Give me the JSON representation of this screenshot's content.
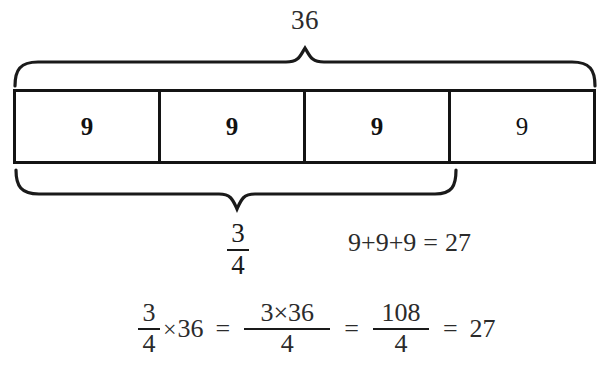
{
  "diagram": {
    "title_label": "36",
    "bar": {
      "cells": [
        {
          "value": "9",
          "emphasis": "bold"
        },
        {
          "value": "9",
          "emphasis": "bold"
        },
        {
          "value": "9",
          "emphasis": "bold"
        },
        {
          "value": "9",
          "emphasis": "regular"
        }
      ]
    },
    "top_brace": {
      "label": "36",
      "spans_cells": 4
    },
    "bottom_brace": {
      "label_numerator": "3",
      "label_denominator": "4",
      "spans_cells": 3
    },
    "sum_line": {
      "terms": "9+9+9",
      "equals": "=",
      "result": "27"
    },
    "equation": {
      "lhs_numerator": "3",
      "lhs_denominator": "4",
      "times": "×",
      "multiplicand": "36",
      "eq1": "=",
      "step1_numerator": "3×36",
      "step1_denominator": "4",
      "eq2": "=",
      "step2_numerator": "108",
      "step2_denominator": "4",
      "eq3": "=",
      "result": "27"
    }
  },
  "colors": {
    "ink": "#1a1a1a",
    "rule": "#141414",
    "background": "#ffffff"
  }
}
